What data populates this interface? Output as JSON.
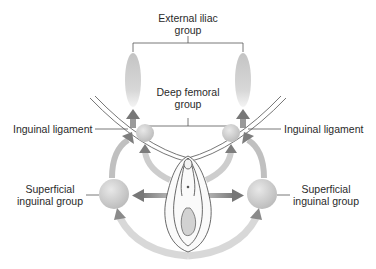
{
  "diagram": {
    "labels": {
      "external_iliac_line1": "External iliac",
      "external_iliac_line2": "group",
      "deep_femoral_line1": "Deep femoral",
      "deep_femoral_line2": "group",
      "inguinal_ligament_left": "Inguinal ligament",
      "inguinal_ligament_right": "Inguinal ligament",
      "superficial_left_line1": "Superficial",
      "superficial_left_line2": "inguinal group",
      "superficial_right_line1": "Superficial",
      "superficial_right_line2": "inguinal group"
    },
    "colors": {
      "node_fill": "#c8c8c8",
      "node_highlight": "#e6e6e6",
      "arrow": "#8a8a8a",
      "line": "#555555",
      "text": "#2a2a2a"
    }
  }
}
